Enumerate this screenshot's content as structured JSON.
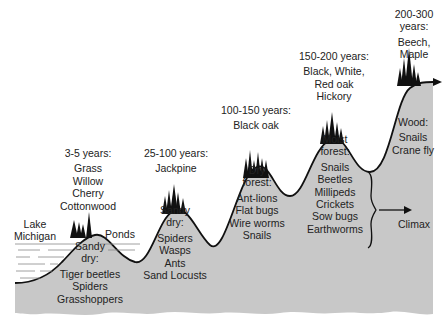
{
  "diagram": {
    "colors": {
      "ground": "#c8c8c8",
      "outline": "#111111",
      "water": "#ffffff",
      "text": "#222222"
    },
    "features": {
      "lake": {
        "line1": "Lake",
        "line2": "Michigan"
      },
      "ponds": "Ponds",
      "climax": "Climax"
    },
    "stages": [
      {
        "age": "3-5 years:",
        "plants": [
          "Grass",
          "Willow",
          "Cherry",
          "Cottonwood"
        ],
        "habitat": [
          "Sandy",
          "dry:"
        ],
        "animals": [
          "Tiger beetles",
          "Spiders",
          "Grasshoppers"
        ]
      },
      {
        "age": "25-100 years:",
        "plants": [
          "Jackpine"
        ],
        "habitat": [
          "Sandy",
          "dry:"
        ],
        "animals": [
          "Spiders",
          "Wasps",
          "Ants",
          "Sand Locusts"
        ]
      },
      {
        "age": "100-150 years:",
        "plants": [
          "Black oak"
        ],
        "habitat": [
          "Dry",
          "forest:"
        ],
        "animals": [
          "Ant-lions",
          "Flat bugs",
          "Wire worms",
          "Snails"
        ]
      },
      {
        "age": "150-200 years:",
        "plants": [
          "Black, White,",
          "Red oak",
          "Hickory"
        ],
        "habitat": [
          "Moist",
          "forest:"
        ],
        "animals": [
          "Snails",
          "Beetles",
          "Millipeds",
          "Crickets",
          "Sow bugs",
          "Earthworms"
        ]
      },
      {
        "age_line1": "200-300",
        "age_line2": "years:",
        "plants": [
          "Beech,",
          "Maple"
        ],
        "habitat": [
          "Wood:"
        ],
        "animals": [
          "Snails",
          "Crane fly"
        ]
      }
    ]
  }
}
